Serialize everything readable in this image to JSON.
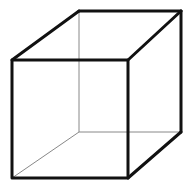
{
  "diagram": {
    "type": "wireframe-cube",
    "background": "#ffffff",
    "colors": {
      "front_edges": "#111111",
      "hidden_edges": "#888888"
    },
    "vertices": {
      "front_top_left": [
        12,
        60
      ],
      "front_top_right": [
        128,
        60
      ],
      "front_bottom_left": [
        12,
        178
      ],
      "front_bottom_right": [
        128,
        178
      ],
      "back_top_left": [
        79,
        11
      ],
      "back_top_right": [
        181,
        11
      ],
      "back_bottom_left": [
        79,
        132
      ],
      "back_bottom_right": [
        181,
        132
      ]
    }
  }
}
